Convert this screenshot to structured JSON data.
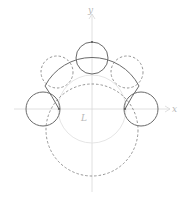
{
  "diagram": {
    "axes": {
      "origin": [
        92,
        109
      ],
      "x_label": "x",
      "y_label": "y",
      "center_label": "L",
      "color": "#d8d8d8"
    },
    "colors": {
      "solid": "#6a6a6a",
      "dashed": "#8a8a8a",
      "light": "#e2e2e2"
    },
    "circles": [
      {
        "name": "outer-solid-arc",
        "cx": 92,
        "cy": 96,
        "r": 53,
        "style": "solid"
      },
      {
        "name": "top-circle",
        "cx": 92,
        "cy": 58,
        "r": 16,
        "style": "solid"
      },
      {
        "name": "upper-left-dashed-circle",
        "cx": 57,
        "cy": 72,
        "r": 16,
        "style": "dashed"
      },
      {
        "name": "upper-right-dashed-circle",
        "cx": 127,
        "cy": 72,
        "r": 16,
        "style": "dashed"
      },
      {
        "name": "left-circle",
        "cx": 43,
        "cy": 109,
        "r": 17,
        "style": "solid"
      },
      {
        "name": "right-circle",
        "cx": 141,
        "cy": 109,
        "r": 17,
        "style": "solid"
      },
      {
        "name": "center-light-circle",
        "cx": 92,
        "cy": 109,
        "r": 34,
        "style": "light"
      },
      {
        "name": "lower-dashed-circle",
        "cx": 92,
        "cy": 130,
        "r": 46,
        "style": "dashed"
      }
    ]
  }
}
